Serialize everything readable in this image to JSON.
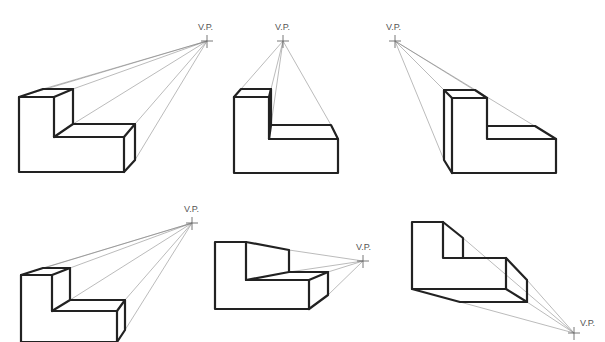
{
  "figures": [
    {
      "id": 1,
      "vp_label": "V.P.",
      "vp": [
        207,
        41
      ]
    },
    {
      "id": 2,
      "vp_label": "V.P.",
      "vp": [
        283,
        41
      ]
    },
    {
      "id": 3,
      "vp_label": "V.P.",
      "vp": [
        395,
        41
      ]
    },
    {
      "id": 4,
      "vp_label": "V.P.",
      "vp": [
        192,
        223
      ]
    },
    {
      "id": 5,
      "vp_label": "V.P.",
      "vp": [
        363,
        261
      ]
    },
    {
      "id": 6,
      "vp_label": "V.P.",
      "vp": [
        574,
        333
      ]
    }
  ]
}
